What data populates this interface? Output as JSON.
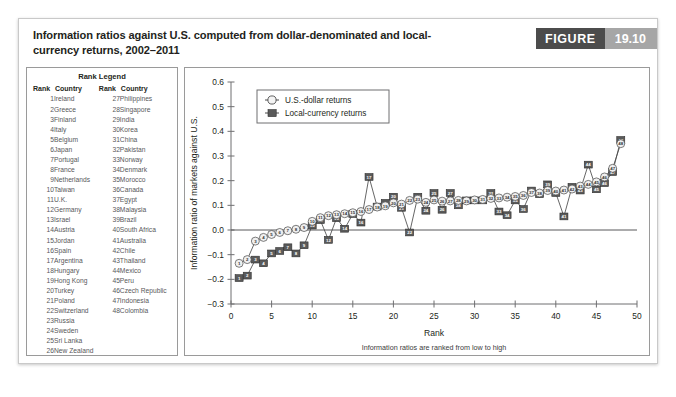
{
  "figure": {
    "title": "Information ratios against U.S. computed from dollar-denominated and local-currency returns, 2002–2011",
    "badge_label": "FIGURE",
    "badge_number": "19.10"
  },
  "rank_legend": {
    "title": "Rank Legend",
    "headers": {
      "rank": "Rank",
      "country": "Country"
    },
    "left_column": [
      {
        "rank": "1",
        "country": "Ireland"
      },
      {
        "rank": "2",
        "country": "Greece"
      },
      {
        "rank": "3",
        "country": "Finland"
      },
      {
        "rank": "4",
        "country": "Italy"
      },
      {
        "rank": "5",
        "country": "Belgium"
      },
      {
        "rank": "6",
        "country": "Japan"
      },
      {
        "rank": "7",
        "country": "Portugal"
      },
      {
        "rank": "8",
        "country": "France"
      },
      {
        "rank": "9",
        "country": "Netherlands"
      },
      {
        "rank": "10",
        "country": "Taiwan"
      },
      {
        "rank": "11",
        "country": "U.K."
      },
      {
        "rank": "12",
        "country": "Germany"
      },
      {
        "rank": "13",
        "country": "Israel"
      },
      {
        "rank": "14",
        "country": "Austria"
      },
      {
        "rank": "15",
        "country": "Jordan"
      },
      {
        "rank": "16",
        "country": "Spain"
      },
      {
        "rank": "17",
        "country": "Argentina"
      },
      {
        "rank": "18",
        "country": "Hungary"
      },
      {
        "rank": "19",
        "country": "Hong Kong"
      },
      {
        "rank": "20",
        "country": "Turkey"
      },
      {
        "rank": "21",
        "country": "Poland"
      },
      {
        "rank": "22",
        "country": "Switzerland"
      },
      {
        "rank": "23",
        "country": "Russia"
      },
      {
        "rank": "24",
        "country": "Sweden"
      },
      {
        "rank": "25",
        "country": "Sri Lanka"
      },
      {
        "rank": "26",
        "country": "New Zealand"
      }
    ],
    "right_column": [
      {
        "rank": "27",
        "country": "Philippines"
      },
      {
        "rank": "28",
        "country": "Singapore"
      },
      {
        "rank": "29",
        "country": "India"
      },
      {
        "rank": "30",
        "country": "Korea"
      },
      {
        "rank": "31",
        "country": "China"
      },
      {
        "rank": "32",
        "country": "Pakistan"
      },
      {
        "rank": "33",
        "country": "Norway"
      },
      {
        "rank": "34",
        "country": "Denmark"
      },
      {
        "rank": "35",
        "country": "Morocco"
      },
      {
        "rank": "36",
        "country": "Canada"
      },
      {
        "rank": "37",
        "country": "Egypt"
      },
      {
        "rank": "38",
        "country": "Malaysia"
      },
      {
        "rank": "39",
        "country": "Brazil"
      },
      {
        "rank": "40",
        "country": "South Africa"
      },
      {
        "rank": "41",
        "country": "Australia"
      },
      {
        "rank": "42",
        "country": "Chile"
      },
      {
        "rank": "43",
        "country": "Thailand"
      },
      {
        "rank": "44",
        "country": "Mexico"
      },
      {
        "rank": "45",
        "country": "Peru"
      },
      {
        "rank": "46",
        "country": "Czech Republic"
      },
      {
        "rank": "47",
        "country": "Indonesia"
      },
      {
        "rank": "48",
        "country": "Colombia"
      },
      {
        "rank": "",
        "country": ""
      },
      {
        "rank": "",
        "country": ""
      },
      {
        "rank": "",
        "country": ""
      },
      {
        "rank": "",
        "country": ""
      }
    ]
  },
  "chart_data": {
    "type": "line",
    "title": "",
    "xlabel": "Rank",
    "ylabel": "Information ratio of markets against U.S.",
    "subcaption": "Information ratios are ranked from low to high",
    "xlim": [
      0,
      50
    ],
    "ylim": [
      -0.3,
      0.6
    ],
    "xticks": [
      0,
      5,
      10,
      15,
      20,
      25,
      30,
      35,
      40,
      45,
      50
    ],
    "yticks": [
      -0.3,
      -0.2,
      -0.1,
      0.0,
      0.1,
      0.2,
      0.3,
      0.4,
      0.5,
      0.6
    ],
    "ytick_labels": [
      "−0.3",
      "−0.2",
      "−0.1",
      "0.0",
      "0.1",
      "0.2",
      "0.3",
      "0.4",
      "0.5",
      "0.6"
    ],
    "grid": false,
    "zero_line": true,
    "legend_position": "top-left",
    "x": [
      1,
      2,
      3,
      4,
      5,
      6,
      7,
      8,
      9,
      10,
      11,
      12,
      13,
      14,
      15,
      16,
      17,
      18,
      19,
      20,
      21,
      22,
      23,
      24,
      25,
      26,
      27,
      28,
      29,
      30,
      31,
      32,
      33,
      34,
      35,
      36,
      37,
      38,
      39,
      40,
      41,
      42,
      43,
      44,
      45,
      46,
      47,
      48
    ],
    "series": [
      {
        "name": "U.S.-dollar returns",
        "marker": "open-circle",
        "color": "#efefef",
        "values": [
          -0.135,
          -0.12,
          -0.045,
          -0.03,
          -0.018,
          -0.01,
          -0.003,
          0.003,
          0.01,
          0.035,
          0.05,
          0.058,
          0.062,
          0.066,
          0.07,
          0.075,
          0.083,
          0.093,
          0.098,
          0.11,
          0.105,
          0.12,
          0.125,
          0.112,
          0.122,
          0.117,
          0.118,
          0.12,
          0.118,
          0.122,
          0.124,
          0.128,
          0.13,
          0.133,
          0.136,
          0.14,
          0.152,
          0.15,
          0.16,
          0.158,
          0.162,
          0.166,
          0.178,
          0.185,
          0.195,
          0.215,
          0.25,
          0.35
        ]
      },
      {
        "name": "Local-currency returns",
        "marker": "filled-square",
        "color": "#5a5a5a",
        "values": [
          -0.195,
          -0.185,
          -0.12,
          -0.135,
          -0.095,
          -0.085,
          -0.07,
          -0.095,
          -0.062,
          0.018,
          0.04,
          -0.04,
          0.048,
          0.005,
          0.065,
          0.03,
          0.215,
          0.095,
          0.11,
          0.135,
          0.09,
          -0.01,
          0.135,
          0.078,
          0.15,
          0.082,
          0.15,
          0.1,
          0.12,
          0.12,
          0.12,
          0.15,
          0.075,
          0.06,
          0.12,
          0.085,
          0.16,
          0.145,
          0.185,
          0.15,
          0.055,
          0.175,
          0.16,
          0.265,
          0.165,
          0.19,
          0.235,
          0.365
        ]
      }
    ]
  }
}
